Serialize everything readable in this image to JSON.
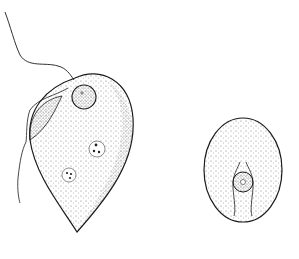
{
  "figure": {
    "background": "#ffffff",
    "ink": "#1a1a1a",
    "stipple": "#555555",
    "organisms": [
      {
        "id": "trophozoite",
        "parts": [
          "body",
          "flagellum",
          "nucleus",
          "vacuole-1",
          "vacuole-2",
          "undulating-membrane"
        ]
      },
      {
        "id": "cyst",
        "parts": [
          "cyst-wall",
          "nucleus",
          "fibrils"
        ]
      }
    ]
  }
}
